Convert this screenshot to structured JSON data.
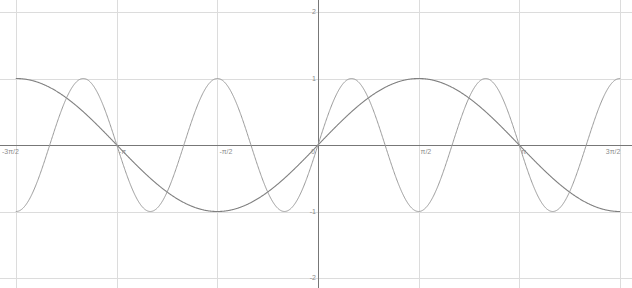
{
  "chart_data": {
    "type": "line",
    "title": "",
    "subtitle": "",
    "xlabel": "",
    "ylabel": "",
    "xlim": [
      -4.71238898,
      4.71238898
    ],
    "ylim": [
      -2,
      2
    ],
    "grid": true,
    "legend": null,
    "legend_position": "none",
    "background_color": "#ffffff",
    "axis_color": "#777777",
    "grid_color": "#dcdcdc",
    "tick_label_color": "#8c8c8c",
    "x_tick_labels": [
      "-3π/2",
      "-π",
      "-π/2",
      "0",
      "π/2",
      "π",
      "3π/2"
    ],
    "x_tick_values": [
      -4.71238898,
      -3.14159265,
      -1.57079633,
      0,
      1.57079633,
      3.14159265,
      4.71238898
    ],
    "y_tick_labels": [
      "2",
      "1",
      "-1",
      "-2"
    ],
    "y_tick_values": [
      2,
      1,
      -1,
      -2
    ],
    "series": [
      {
        "name": "sin(x)",
        "expression": "sin(x)",
        "amplitude": 1,
        "frequency": 1,
        "phase": 0,
        "color": "#808080",
        "line_width": 1.1,
        "x": [
          -4.71238898,
          -4.39822972,
          -4.08407045,
          -3.76991118,
          -3.45575192,
          -3.14159265,
          -2.82743339,
          -2.51327412,
          -2.19911486,
          -1.88495559,
          -1.57079633,
          -1.25663706,
          -0.9424778,
          -0.62831853,
          -0.31415927,
          0,
          0.31415927,
          0.62831853,
          0.9424778,
          1.25663706,
          1.57079633,
          1.88495559,
          2.19911486,
          2.51327412,
          2.82743339,
          3.14159265,
          3.45575192,
          3.76991118,
          4.08407045,
          4.39822972,
          4.71238898
        ],
        "y": [
          1,
          0.95105652,
          0.80901699,
          0.58778525,
          0.30901699,
          0,
          -0.30901699,
          -0.58778525,
          -0.80901699,
          -0.95105652,
          -1,
          -0.95105652,
          -0.80901699,
          -0.58778525,
          -0.30901699,
          0,
          0.30901699,
          0.58778525,
          0.80901699,
          0.95105652,
          1,
          0.95105652,
          0.80901699,
          0.58778525,
          0.30901699,
          0,
          -0.30901699,
          -0.58778525,
          -0.80901699,
          -0.95105652,
          -1
        ]
      },
      {
        "name": "sin(3x)",
        "expression": "sin(3x)",
        "amplitude": 1,
        "frequency": 3,
        "phase": 0,
        "color": "#9a9a9a",
        "line_width": 1.0,
        "x": [
          -4.71238898,
          -4.6,
          -4.45,
          -4.29,
          -4.08,
          -3.87,
          -3.66,
          -3.4,
          -3.14159265,
          -2.88,
          -2.62,
          -2.41,
          -2.2,
          -1.99,
          -1.83,
          -1.68,
          -1.57079633,
          -1.46,
          -1.31,
          -1.15,
          -0.94,
          -0.73,
          -0.52,
          -0.26,
          0,
          0.26,
          0.52,
          0.73,
          0.94,
          1.15,
          1.31,
          1.46,
          1.57079633,
          1.68,
          1.83,
          1.99,
          2.2,
          2.41,
          2.62,
          2.88,
          3.14159265,
          3.4,
          3.66,
          3.87,
          4.08,
          4.29,
          4.45,
          4.6,
          4.71238898
        ],
        "y": [
          1,
          0.95,
          0.71,
          0.31,
          -0.31,
          -0.81,
          -1.0,
          -0.59,
          0,
          0.59,
          1.0,
          0.81,
          0.31,
          -0.31,
          -0.81,
          -1.0,
          -1,
          -0.95,
          -0.71,
          -0.31,
          0.31,
          0.81,
          1.0,
          0.59,
          0,
          -0.59,
          -1.0,
          -0.81,
          -0.31,
          0.31,
          0.81,
          1.0,
          1,
          0.95,
          0.71,
          0.31,
          -0.31,
          -0.81,
          -1.0,
          -0.59,
          0,
          0.59,
          1.0,
          0.81,
          0.31,
          -0.31,
          -0.81,
          -0.95,
          -1
        ]
      }
    ]
  }
}
